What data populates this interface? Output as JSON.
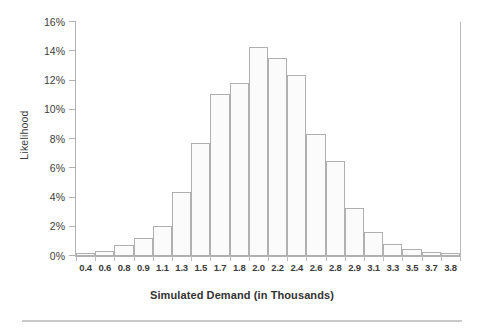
{
  "chart_data": {
    "type": "bar",
    "title": "",
    "xlabel": "Simulated Demand (in Thousands)",
    "ylabel": "Likelihood",
    "categories": [
      "0.4",
      "0.6",
      "0.8",
      "0.9",
      "1.1",
      "1.3",
      "1.5",
      "1.7",
      "1.8",
      "2.0",
      "2.2",
      "2.4",
      "2.6",
      "2.8",
      "2.9",
      "3.1",
      "3.3",
      "3.5",
      "3.7",
      "3.8"
    ],
    "values": [
      0.2,
      0.35,
      0.75,
      1.2,
      2.05,
      4.35,
      7.7,
      11.1,
      11.85,
      14.3,
      13.55,
      12.4,
      8.35,
      6.5,
      3.3,
      1.65,
      0.85,
      0.5,
      0.3,
      0.2
    ],
    "ylim": [
      0,
      16
    ],
    "ytick_values": [
      0,
      2,
      4,
      6,
      8,
      10,
      12,
      14,
      16
    ],
    "ytick_labels": [
      "0%",
      "2%",
      "4%",
      "6%",
      "8%",
      "10%",
      "12%",
      "14%",
      "16%"
    ],
    "grid": false,
    "legend": "none",
    "bar_fill": "#fbfbfb",
    "bar_stroke": "#b0b0b0",
    "axis_color": "#b2b2b2",
    "text_color": "#3d3d3d"
  }
}
